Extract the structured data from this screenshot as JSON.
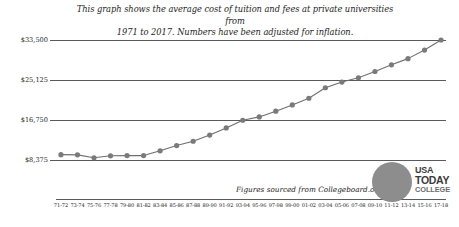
{
  "title": {
    "line1": "This graph shows the average cost of tuition and fees at private universities from",
    "line2": "1971 to 2017. Numbers have been adjusted for inflation."
  },
  "source_note": "Figures sourced from Collegeboard.org",
  "logo": {
    "line1": "USA",
    "line2": "TODAY",
    "line3": "COLLEGE",
    "circle_color": "#8d8d8d"
  },
  "colors": {
    "line": "#6e6e6e",
    "marker": "#7a7a7a",
    "grid": "#5a5a5a",
    "text": "#1d1d1d"
  },
  "chart_data": {
    "type": "line",
    "title": "This graph shows the average cost of tuition and fees at private universities from 1971 to 2017. Numbers have been adjusted for inflation.",
    "xlabel": "",
    "ylabel": "",
    "ylim": [
      0,
      33500
    ],
    "grid": true,
    "legend": "none",
    "ytick_labels": [
      "$33,500",
      "$25,125",
      "$16,750",
      "$8,375"
    ],
    "ytick_values": [
      33500,
      25125,
      16750,
      8375
    ],
    "categories": [
      "71-72",
      "73-74",
      "75-76",
      "77-78",
      "79-80",
      "81-82",
      "83-84",
      "85-86",
      "87-88",
      "89-90",
      "91-92",
      "93-94",
      "95-96",
      "97-98",
      "99-00",
      "01-02",
      "03-04",
      "05-06",
      "07-08",
      "09-10",
      "11-12",
      "13-14",
      "15-16",
      "17-18"
    ],
    "values": [
      9500,
      9450,
      8850,
      9250,
      9300,
      9300,
      10300,
      11400,
      12300,
      13600,
      15100,
      16700,
      17400,
      18600,
      19900,
      21300,
      23500,
      24700,
      25600,
      26900,
      28300,
      29600,
      31400,
      33500
    ],
    "series": [
      {
        "name": "Average cost of tuition and fees at private universities",
        "values": [
          9500,
          9450,
          8850,
          9250,
          9300,
          9300,
          10300,
          11400,
          12300,
          13600,
          15100,
          16700,
          17400,
          18600,
          19900,
          21300,
          23500,
          24700,
          25600,
          26900,
          28300,
          29600,
          31400,
          33500
        ]
      }
    ]
  }
}
